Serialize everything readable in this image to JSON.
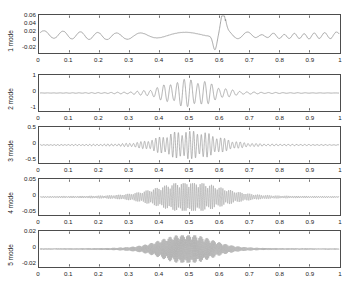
{
  "figure": {
    "title": "",
    "background": "#ffffff",
    "line_color": "#808080",
    "axis_color": "#4d4d4d",
    "text_color": "#1a1a1a"
  },
  "chart_data": {
    "type": "line",
    "title": "",
    "xlabel": "",
    "ylabel": "",
    "grid": false,
    "legend": "none",
    "shared_x": {
      "xlim": [
        0,
        1
      ],
      "xticks": [
        0,
        0.1,
        0.2,
        0.3,
        0.4,
        0.5,
        0.6,
        0.7,
        0.8,
        0.9,
        1
      ],
      "xticklabels": [
        "0",
        "0.1",
        "0.2",
        "0.3",
        "0.4",
        "0.5",
        "0.6",
        "0.7",
        "0.8",
        "0.9",
        "1"
      ]
    },
    "panels": [
      {
        "id": "mode1",
        "ylabel": "1 mode",
        "ylim": [
          -0.03,
          0.06
        ],
        "yticks": [
          0.06,
          0.04,
          0.02,
          0,
          -0.02
        ],
        "yticklabels": [
          "0.06",
          "0.04",
          "0.02",
          "0",
          "-0.02"
        ],
        "description": "slow low-frequency ripple about 0.012 baseline with a sharp downward-then-upward spike near x=0.58-0.61",
        "carrier_hz": 14,
        "baseline": 0.012,
        "ripple_amp": 0.008,
        "spike": {
          "x": 0.585,
          "down": -0.035,
          "up": 0.065,
          "width": 0.035
        }
      },
      {
        "id": "mode2",
        "ylabel": "2 mode",
        "ylim": [
          -1.25,
          1.25
        ],
        "yticks": [
          1,
          0,
          -1
        ],
        "yticklabels": [
          "1",
          "0",
          "-1"
        ],
        "description": "wave packet centred near x=0.5, amplitude up to 1",
        "carrier_hz": 46,
        "center": 0.5,
        "sigma": 0.075,
        "peak": 1.0
      },
      {
        "id": "mode3",
        "ylabel": "3 mode",
        "ylim": [
          -0.62,
          0.62
        ],
        "yticks": [
          0.5,
          0,
          -0.5
        ],
        "yticklabels": [
          "0.5",
          "0",
          "-0.5"
        ],
        "description": "wave packet centred near x=0.5, amplitude up to 0.5",
        "carrier_hz": 82,
        "center": 0.5,
        "sigma": 0.085,
        "peak": 0.5
      },
      {
        "id": "mode4",
        "ylabel": "4 mode",
        "ylim": [
          -0.062,
          0.062
        ],
        "yticks": [
          0.05,
          0,
          -0.05
        ],
        "yticklabels": [
          "0.05",
          "0",
          "-0.05"
        ],
        "description": "dense high-frequency burst from x=0.3 to 0.75, amplitude up to 0.05",
        "carrier_hz": 165,
        "center": 0.5,
        "sigma": 0.1,
        "peak": 0.05
      },
      {
        "id": "mode5",
        "ylabel": "5 mode",
        "ylim": [
          -0.025,
          0.025
        ],
        "yticks": [
          0.02,
          0,
          -0.02
        ],
        "yticklabels": [
          "0.02",
          "0",
          "-0.02"
        ],
        "description": "very dense high-frequency burst from x=0.33 to 0.68, amplitude up to 0.02",
        "carrier_hz": 300,
        "center": 0.49,
        "sigma": 0.08,
        "peak": 0.02
      }
    ]
  }
}
